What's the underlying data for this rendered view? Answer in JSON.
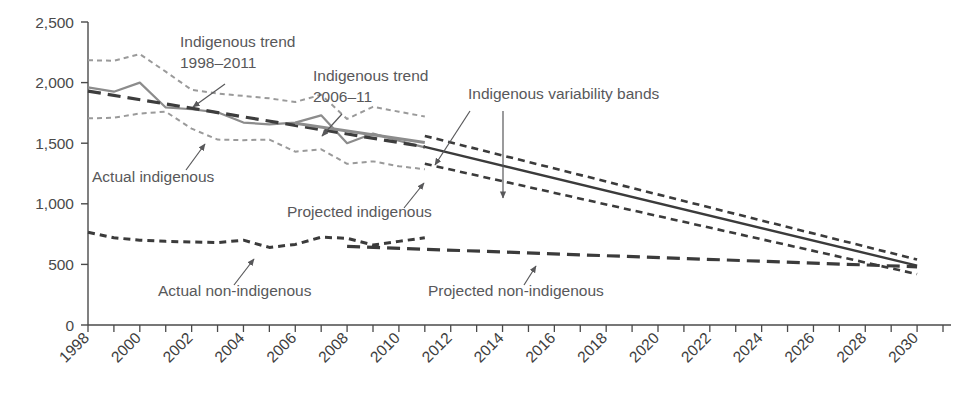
{
  "chart_data": {
    "type": "line",
    "title": "",
    "subtitle": "",
    "xlabel": "",
    "ylabel": "",
    "xlim": [
      1998,
      2031
    ],
    "ylim": [
      0,
      2500
    ],
    "grid": false,
    "legend_position": "inline-annotations",
    "y_ticks": [
      "0",
      "500",
      "1,000",
      "1,500",
      "2,000",
      "2,500"
    ],
    "y_tick_values": [
      0,
      500,
      1000,
      1500,
      2000,
      2500
    ],
    "x_ticks": [
      "1998",
      "2000",
      "2002",
      "2004",
      "2006",
      "2008",
      "2010",
      "2012",
      "2014",
      "2016",
      "2018",
      "2020",
      "2022",
      "2024",
      "2026",
      "2028",
      "2030"
    ],
    "x_tick_values": [
      1998,
      2000,
      2002,
      2004,
      2006,
      2008,
      2010,
      2012,
      2014,
      2016,
      2018,
      2020,
      2022,
      2024,
      2026,
      2028,
      2030
    ],
    "x_minor_step": 1,
    "series": [
      {
        "name": "Actual indigenous",
        "style": "solid-gray",
        "color": "#8c8c8c",
        "x": [
          1998,
          1999,
          2000,
          2001,
          2002,
          2003,
          2004,
          2005,
          2006,
          2007,
          2008,
          2009,
          2010,
          2011
        ],
        "values": [
          1960,
          1925,
          2000,
          1795,
          1780,
          1755,
          1670,
          1655,
          1670,
          1730,
          1500,
          1580,
          1520,
          1465
        ]
      },
      {
        "name": "Indigenous trend 1998–2011",
        "style": "long-dash-dark",
        "color": "#3d3d3d",
        "x": [
          1998,
          2011
        ],
        "values": [
          1930,
          1470
        ]
      },
      {
        "name": "Indigenous trend 2006–11",
        "style": "solid-gray-thick",
        "color": "#8c8c8c",
        "x": [
          2006,
          2011
        ],
        "values": [
          1665,
          1505
        ]
      },
      {
        "name": "Indigenous variability bands upper (actual)",
        "style": "dotted-gray",
        "color": "#9a9a9a",
        "x": [
          1998,
          1999,
          2000,
          2001,
          2002,
          2003,
          2004,
          2005,
          2006,
          2007,
          2008,
          2009,
          2010,
          2011
        ],
        "values": [
          2185,
          2180,
          2235,
          2090,
          1940,
          1910,
          1890,
          1870,
          1840,
          1900,
          1700,
          1800,
          1760,
          1720
        ]
      },
      {
        "name": "Indigenous variability bands lower (actual)",
        "style": "dotted-gray",
        "color": "#9a9a9a",
        "x": [
          1998,
          1999,
          2000,
          2001,
          2002,
          2003,
          2004,
          2005,
          2006,
          2007,
          2008,
          2009,
          2010,
          2011
        ],
        "values": [
          1705,
          1710,
          1745,
          1760,
          1620,
          1530,
          1525,
          1530,
          1430,
          1450,
          1330,
          1350,
          1310,
          1285
        ]
      },
      {
        "name": "Projected indigenous",
        "style": "solid-dark",
        "color": "#3b3b3b",
        "x": [
          2011,
          2030
        ],
        "values": [
          1470,
          490
        ]
      },
      {
        "name": "Indigenous variability band upper (projected)",
        "style": "dashed-dark",
        "color": "#3b3b3b",
        "x": [
          2011,
          2030
        ],
        "values": [
          1560,
          540
        ]
      },
      {
        "name": "Indigenous variability band lower (projected)",
        "style": "dashed-dark",
        "color": "#3b3b3b",
        "x": [
          2011,
          2030
        ],
        "values": [
          1330,
          420
        ]
      },
      {
        "name": "Actual non-indigenous",
        "style": "short-dash-dark",
        "color": "#3b3b3b",
        "x": [
          1998,
          1999,
          2000,
          2001,
          2002,
          2003,
          2004,
          2005,
          2006,
          2007,
          2008,
          2009,
          2010,
          2011
        ],
        "values": [
          765,
          720,
          700,
          690,
          685,
          680,
          700,
          640,
          665,
          725,
          715,
          660,
          690,
          720
        ]
      },
      {
        "name": "Projected non-indigenous",
        "style": "long-dash-dark",
        "color": "#3b3b3b",
        "x": [
          2008,
          2030
        ],
        "values": [
          648,
          480
        ]
      }
    ],
    "annotations": [
      {
        "id": "ann-indigenous-trend-1998-2011",
        "lines": [
          "Indigenous trend",
          "1998–2011"
        ],
        "x": 180,
        "y": 47,
        "arrow": {
          "x1": 225,
          "y1": 84,
          "x2": 193,
          "y2": 107
        }
      },
      {
        "id": "ann-indigenous-trend-2006-11",
        "lines": [
          "Indigenous trend",
          "2006–11"
        ],
        "x": 313,
        "y": 81,
        "arrow": {
          "x1": 342,
          "y1": 114,
          "x2": 322,
          "y2": 136
        }
      },
      {
        "id": "ann-indigenous-variability-bands",
        "lines": [
          "Indigenous variability bands"
        ],
        "x": 468,
        "y": 99,
        "arrow1": {
          "x1": 470,
          "y1": 111,
          "x2": 435,
          "y2": 165
        },
        "arrow2": {
          "x1": 503,
          "y1": 111,
          "x2": 503,
          "y2": 198
        }
      },
      {
        "id": "ann-actual-indigenous",
        "lines": [
          "Actual indigenous"
        ],
        "x": 92,
        "y": 182,
        "arrow": {
          "x1": 186,
          "y1": 170,
          "x2": 205,
          "y2": 144
        }
      },
      {
        "id": "ann-projected-indigenous",
        "lines": [
          "Projected indigenous"
        ],
        "x": 287,
        "y": 217,
        "arrow": {
          "x1": 404,
          "y1": 208,
          "x2": 424,
          "y2": 183
        }
      },
      {
        "id": "ann-actual-non-indigenous",
        "lines": [
          "Actual non-indigenous"
        ],
        "x": 158,
        "y": 296,
        "arrow": {
          "x1": 234,
          "y1": 285,
          "x2": 254,
          "y2": 259
        }
      },
      {
        "id": "ann-projected-non-indigenous",
        "lines": [
          "Projected non-indigenous"
        ],
        "x": 428,
        "y": 296,
        "arrow": {
          "x1": 524,
          "y1": 285,
          "x2": 536,
          "y2": 266
        }
      }
    ]
  }
}
